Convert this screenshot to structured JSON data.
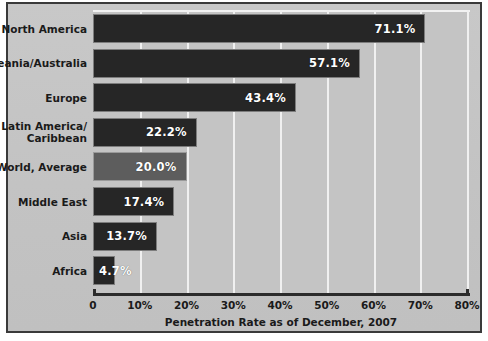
{
  "chart_data": {
    "type": "bar",
    "orientation": "horizontal",
    "title": "",
    "xlabel": "Penetration Rate as of December, 2007",
    "ylabel": "",
    "xlim": [
      0,
      80
    ],
    "grid": true,
    "legend": "none",
    "xticks": [
      "0",
      "10%",
      "20%",
      "30%",
      "40%",
      "50%",
      "60%",
      "70%",
      "80%"
    ],
    "xtick_values": [
      0,
      10,
      20,
      30,
      40,
      50,
      60,
      70,
      80
    ],
    "categories": [
      "North America",
      "Oceania/Australia",
      "Europe",
      "Latin America/\nCaribbean",
      "World, Average",
      "Middle East",
      "Asia",
      "Africa"
    ],
    "values": [
      71.1,
      57.1,
      43.4,
      22.2,
      20.0,
      17.4,
      13.7,
      4.7
    ],
    "value_labels": [
      "71.1%",
      "57.1%",
      "43.4%",
      "22.2%",
      "20.0%",
      "17.4%",
      "13.7%",
      "4.7%"
    ],
    "highlight_index": 4,
    "colors": {
      "bar": "#262626",
      "bar_highlight": "#5d5d5d",
      "plot_background": "#c4c4c4",
      "figure_background": "#c6c6c6",
      "gridline": "#f0f0f0",
      "axis": "#2b2b2b",
      "text": "#1a1a1a",
      "value_text": "#ffffff",
      "frame_border": "#3a3a3a"
    }
  }
}
